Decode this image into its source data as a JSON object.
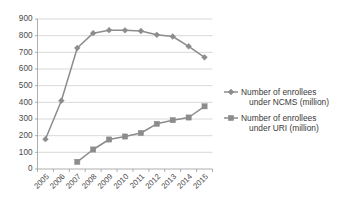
{
  "chart_data": {
    "type": "line",
    "title": "",
    "xlabel": "",
    "ylabel": "",
    "categories": [
      "2005",
      "2006",
      "2007",
      "2008",
      "2009",
      "2010",
      "2011",
      "2012",
      "2013",
      "2014",
      "2015"
    ],
    "ylim": [
      0,
      900
    ],
    "ytick_labels": [
      "0",
      "100",
      "200",
      "300",
      "400",
      "500",
      "600",
      "700",
      "800",
      "900"
    ],
    "ytick_values": [
      0,
      100,
      200,
      300,
      400,
      500,
      600,
      700,
      800,
      900
    ],
    "grid": true,
    "legend_position": "right",
    "series": [
      {
        "name": "Number of enrollees under NCMS (million)",
        "legend_line_1": "Number of enrollees",
        "legend_line_2": "under NCMS (million)",
        "marker": "diamond",
        "color": "#8c8c8c",
        "values": [
          179,
          410,
          726,
          815,
          833,
          832,
          828,
          805,
          795,
          736,
          670
        ]
      },
      {
        "name": "Number of enrollees under URI (million)",
        "legend_line_1": "Number of enrollees",
        "legend_line_2": "under URI (million)",
        "marker": "square",
        "color": "#8c8c8c",
        "values": [
          null,
          null,
          43,
          117,
          177,
          195,
          216,
          271,
          293,
          309,
          376
        ]
      }
    ]
  }
}
